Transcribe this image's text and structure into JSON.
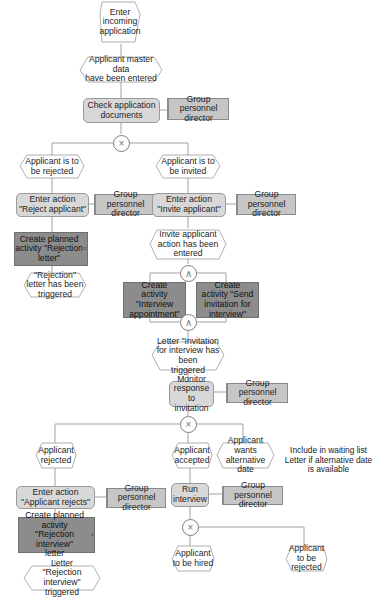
{
  "diagram": {
    "type": "EPC process chain",
    "colors": {
      "event_fill": "#ffffff",
      "event_stroke": "#9a9a9a",
      "function_fill": "#d8d8d8",
      "activity_fill": "#8c8c8c",
      "org_fill": "#c6c6c6",
      "line": "#8a8a8a"
    },
    "nodes": {
      "enter_incoming": "Enter\nincoming\napplication",
      "master_data": "Applicant master data\nhave been entered",
      "check_docs": "Check application\ndocuments",
      "org1": "Group personnel\ndirector",
      "to_be_rejected": "Applicant is to\nbe rejected",
      "to_be_invited": "Applicant is to\nbe invited",
      "enter_reject": "Enter action\n\"Reject applicant\"",
      "org2": "Group personnel\ndirector",
      "enter_invite": "Enter action\n\"Invite applicant\"",
      "org3": "Group personnel\ndirector",
      "create_rejection_letter": "Create planned\nactivity \"Rejection\nletter\"",
      "invite_entered": "Invite applicant\naction has been\nentered",
      "rejection_triggered": "\"Rejection\"\nletter has been\ntriggered",
      "create_interview_appt": "Create\nactivity \"Interview\nappointment\"",
      "create_send_invitation": "Create\nactivity \"Send\ninvitation for\ninterview\"",
      "invitation_triggered": "Letter \"Invitation\nfor interview has been\ntriggered",
      "monitor_response": "Monitor\nresponse to\ninvitation",
      "org4": "Group personnel\ndirector",
      "applicant_rejected": "Applicant\nrejected",
      "applicant_accepted": "Applicant\naccepted",
      "alt_date": "Applicant\nwants\nalternative date",
      "note_waiting": "Include in waiting list\nLetter if alternative date\nis available",
      "enter_applicant_rejects": "Enter action\n\"Applicant rejects\"",
      "org5": "Group personnel\ndirector",
      "run_interview": "Run\ninterview",
      "org6": "Group personnel\ndirector",
      "create_rejection_interview": "Create planned\nactivity\n\"Rejection interview\"\nletter",
      "to_be_hired": "Applicant\nto be hired",
      "to_be_rejected2": "Applicant\nto be rejected",
      "rejection_interview_triggered": "Letter\n\"Rejection interview\"\ntriggered"
    },
    "connectors": {
      "xor1": "×",
      "and1": "∧",
      "and2": "∧",
      "xor2": "×",
      "xor3": "×"
    },
    "mini_icon_label": "≡"
  }
}
